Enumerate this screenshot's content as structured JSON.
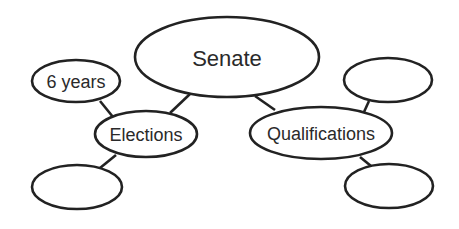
{
  "diagram": {
    "type": "concept-web",
    "colors": {
      "stroke": "#222222",
      "text": "#2a2a2a",
      "background": "#ffffff"
    },
    "nodes": [
      {
        "id": "senate",
        "label": "Senate",
        "cx": 227,
        "cy": 57,
        "rx": 92,
        "ry": 40,
        "font_size": 22
      },
      {
        "id": "elections",
        "label": "Elections",
        "cx": 146,
        "cy": 134,
        "rx": 51,
        "ry": 23,
        "font_size": 18
      },
      {
        "id": "qualifications",
        "label": "Qualifications",
        "cx": 321,
        "cy": 133,
        "rx": 71,
        "ry": 26,
        "font_size": 18
      },
      {
        "id": "six-years",
        "label": "6 years",
        "cx": 76,
        "cy": 81,
        "rx": 44,
        "ry": 21,
        "font_size": 18
      },
      {
        "id": "elections-blank",
        "label": "",
        "cx": 77,
        "cy": 187,
        "rx": 45,
        "ry": 22,
        "font_size": 18
      },
      {
        "id": "qualifications-blank-top",
        "label": "",
        "cx": 388,
        "cy": 80,
        "rx": 44,
        "ry": 22,
        "font_size": 18
      },
      {
        "id": "qualifications-blank-bottom",
        "label": "",
        "cx": 389,
        "cy": 186,
        "rx": 44,
        "ry": 22,
        "font_size": 18
      }
    ],
    "edges": [
      {
        "from": "senate",
        "to": "elections",
        "x1": 190,
        "y1": 94,
        "x2": 170,
        "y2": 113
      },
      {
        "from": "senate",
        "to": "qualifications",
        "x1": 255,
        "y1": 96,
        "x2": 275,
        "y2": 110
      },
      {
        "from": "elections",
        "to": "six-years",
        "x1": 100,
        "y1": 101,
        "x2": 113,
        "y2": 117
      },
      {
        "from": "elections",
        "to": "elections-blank",
        "x1": 116,
        "y1": 155,
        "x2": 100,
        "y2": 168
      },
      {
        "from": "qualifications",
        "to": "qualifications-blank-top",
        "x1": 364,
        "y1": 112,
        "x2": 369,
        "y2": 101
      },
      {
        "from": "qualifications",
        "to": "qualifications-blank-bottom",
        "x1": 360,
        "y1": 157,
        "x2": 371,
        "y2": 166
      }
    ]
  }
}
